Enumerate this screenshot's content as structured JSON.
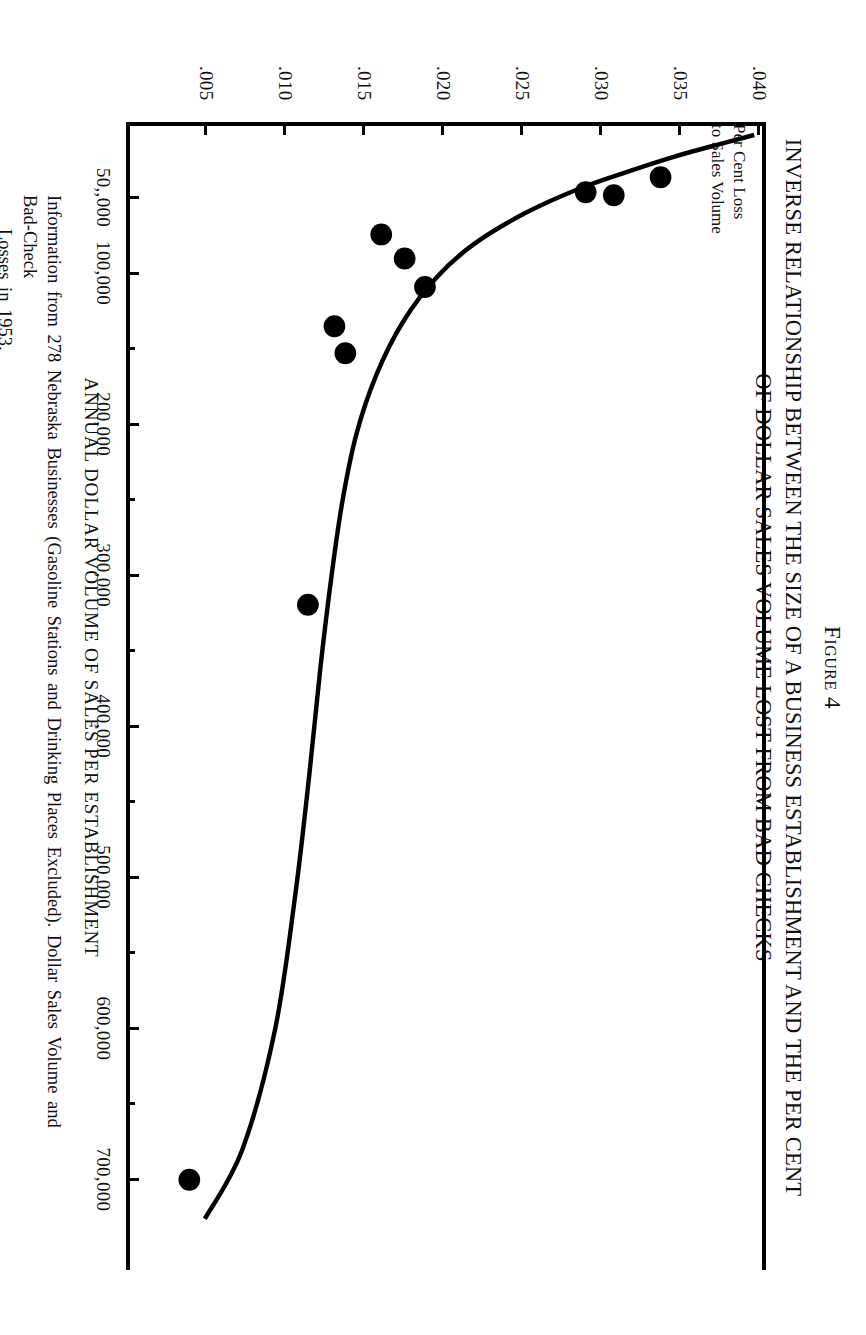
{
  "figure": {
    "number_label": "Figure 4",
    "title_line1": "INVERSE RELATIONSHIP BETWEEN THE SIZE OF A BUSINESS ESTABLISHMENT AND THE PER CENT",
    "title_line2": "OF DOLLAR SALES VOLUME LOST FROM BAD CHECKS"
  },
  "yaxis_caption": {
    "line1": "Per Cent Loss",
    "line2": "to Sales Volume"
  },
  "source_note": {
    "line1": "Information from 278 Nebraska Businesses (Gasoline Stations and Drinking Places Excluded). Dollar Sales Volume and Bad-Check",
    "line2": "Losses in 1953."
  },
  "chart_data": {
    "type": "scatter",
    "title": "INVERSE RELATIONSHIP BETWEEN THE SIZE OF A BUSINESS ESTABLISHMENT AND THE PER CENT OF DOLLAR SALES VOLUME LOST FROM BAD CHECKS",
    "xlabel": "ANNUAL DOLLAR VOLUME OF SALES PER ESTABLISHMENT",
    "ylabel": "Per Cent Loss to Sales Volume",
    "xlim": [
      0,
      760000
    ],
    "ylim": [
      0,
      0.0405
    ],
    "grid": false,
    "legend": null,
    "xticks": [
      50000,
      100000,
      200000,
      300000,
      400000,
      500000,
      600000,
      700000
    ],
    "xtick_labels": [
      "50,,000",
      "100,000",
      "200,000",
      "300,000",
      "400,000",
      "500,000",
      "600,000",
      "700,000"
    ],
    "xminor_ticks": [
      150000,
      250000,
      350000,
      450000,
      550000,
      650000
    ],
    "yticks": [
      0.04,
      0.035,
      0.03,
      0.025,
      0.02,
      0.015,
      0.01,
      0.005
    ],
    "ytick_labels": [
      ".040",
      ".035",
      ".030",
      ".025",
      ".020",
      ".015",
      ".010",
      ".005"
    ],
    "points": [
      {
        "x": 34000,
        "y": 0.034
      },
      {
        "x": 44000,
        "y": 0.0292
      },
      {
        "x": 46000,
        "y": 0.031
      },
      {
        "x": 72000,
        "y": 0.0161
      },
      {
        "x": 88000,
        "y": 0.0176
      },
      {
        "x": 107000,
        "y": 0.0189
      },
      {
        "x": 133000,
        "y": 0.0131
      },
      {
        "x": 151000,
        "y": 0.0138
      },
      {
        "x": 318000,
        "y": 0.0114
      },
      {
        "x": 700000,
        "y": 0.0038
      }
    ],
    "fitted_curve": {
      "name": "fitted inverse curve",
      "x": [
        6000,
        12000,
        20000,
        30000,
        42000,
        58000,
        78000,
        100000,
        130000,
        165000,
        205000,
        250000,
        300000,
        360000,
        430000,
        510000,
        600000,
        680000,
        726000
      ],
      "y": [
        0.04,
        0.0378,
        0.035,
        0.032,
        0.0287,
        0.0253,
        0.0221,
        0.0197,
        0.0175,
        0.0158,
        0.0145,
        0.0136,
        0.0129,
        0.0122,
        0.0115,
        0.0106,
        0.0093,
        0.0072,
        0.0048
      ]
    }
  }
}
